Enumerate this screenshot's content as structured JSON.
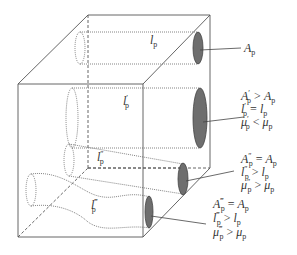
{
  "figure": {
    "pores": [
      {
        "id": "pore-1",
        "length_label": "l_p",
        "length_label_main": "l",
        "length_label_prime": "",
        "relations": [
          {
            "lhs_main": "A",
            "lhs_prime": "",
            "op": "",
            "rhs_main": "A",
            "rhs_sub": "p",
            "single": true
          }
        ]
      },
      {
        "id": "pore-2",
        "length_label": "l'_p",
        "length_label_main": "l",
        "length_label_prime": "′",
        "relations": [
          {
            "lhs_main": "A",
            "lhs_prime": "′",
            "op": ">",
            "rhs_main": "A",
            "rhs_sub": "p"
          },
          {
            "lhs_main": "l",
            "lhs_prime": "′",
            "op": "=",
            "rhs_main": "l",
            "rhs_sub": "p"
          },
          {
            "lhs_main": "μ",
            "lhs_prime": "′",
            "op": "<",
            "rhs_main": "μ",
            "rhs_sub": "p"
          }
        ]
      },
      {
        "id": "pore-3",
        "length_label": "l''_p",
        "length_label_main": "l",
        "length_label_prime": "″",
        "relations": [
          {
            "lhs_main": "A",
            "lhs_prime": "″",
            "op": "=",
            "rhs_main": "A",
            "rhs_sub": "p"
          },
          {
            "lhs_main": "l",
            "lhs_prime": "″",
            "op": ">",
            "rhs_main": "l",
            "rhs_sub": "p"
          },
          {
            "lhs_main": "μ",
            "lhs_prime": "″",
            "op": ">",
            "rhs_main": "μ",
            "rhs_sub": "p"
          }
        ]
      },
      {
        "id": "pore-4",
        "length_label": "l'''_p",
        "length_label_main": "l",
        "length_label_prime": "‴",
        "relations": [
          {
            "lhs_main": "A",
            "lhs_prime": "‴",
            "op": "=",
            "rhs_main": "A",
            "rhs_sub": "p"
          },
          {
            "lhs_main": "l",
            "lhs_prime": "‴",
            "op": ">",
            "rhs_main": "l",
            "rhs_sub": "p"
          },
          {
            "lhs_main": "μ",
            "lhs_prime": "‴",
            "op": ">",
            "rhs_main": "μ",
            "rhs_sub": "p"
          }
        ]
      }
    ],
    "subscript": "p",
    "colors": {
      "line": "#555555",
      "pore_fill": "#6e6e6e",
      "text": "#333333"
    }
  }
}
